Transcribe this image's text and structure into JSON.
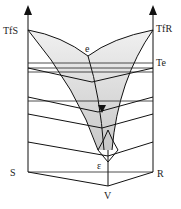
{
  "diagram": {
    "type": "ternary-phase-diagram-prism",
    "labels": {
      "left_melting_point": "TfS",
      "right_melting_point": "TfR",
      "eutectic_temperature": "Te",
      "binary_eutectic": "e",
      "ternary_eutectic": "ε",
      "left_base_corner": "S",
      "right_base_corner": "R",
      "front_base_corner": "V"
    },
    "colors": {
      "line": "#111111",
      "surface_fill": "#e6e6e6",
      "surface_fill_dark": "#cfcfcf",
      "background": "#ffffff"
    },
    "isotherm_count": 4
  }
}
